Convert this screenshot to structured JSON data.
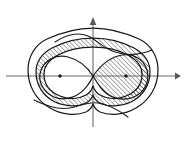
{
  "figure": {
    "width": 187,
    "height": 145,
    "background_color": "#ffffff",
    "line_color": "#1a1a1a",
    "axis_color": "#6b6b6b",
    "hatch_color": "#222222",
    "hatch_angle_degrees": 45,
    "hatch_spacing_px": 3.2
  },
  "axes": {
    "x_axis": {
      "label": "",
      "y_position": 76,
      "x_start": 6,
      "x_end": 181,
      "has_left_arrow": false,
      "has_right_arrow": true
    },
    "y_axis": {
      "label": "",
      "x_position": 93,
      "y_start": 127,
      "y_end": 19,
      "has_top_arrow": true,
      "has_bottom_arrow": false
    },
    "origin": {
      "x": 93,
      "y": 76
    }
  },
  "foci": [
    {
      "name": "left-focus",
      "x": 60,
      "y": 76
    },
    {
      "name": "right-focus",
      "x": 126,
      "y": 76
    }
  ],
  "curves": [
    {
      "name": "outer-oval",
      "type": "closed-cassini-oval",
      "description": "outermost single closed oval enclosing both foci"
    },
    {
      "name": "middle-oval",
      "type": "closed-cassini-oval",
      "description": "middle closed oval, outer edge of hatched band"
    },
    {
      "name": "inner-pinched-oval",
      "type": "closed-pinched-oval",
      "description": "inner waisted oval, inner edge of hatched band"
    },
    {
      "name": "lemniscate-left-lobe",
      "type": "lemniscate-branch",
      "description": "left lobe of the figure-eight through the origin"
    },
    {
      "name": "lemniscate-right-lobe",
      "type": "lemniscate-branch",
      "description": "right lobe of the figure-eight through the origin"
    },
    {
      "name": "upper-open-branch",
      "type": "open-hyperbolic-branch",
      "description": "open curve tail crossing above the origin"
    },
    {
      "name": "lower-open-branch",
      "type": "open-hyperbolic-branch",
      "description": "open curve tail crossing below the origin"
    }
  ],
  "regions": [
    {
      "name": "hatched-band",
      "fill": "diagonal-hatch",
      "description": "annular band between middle-oval and inner-pinched-oval"
    },
    {
      "name": "hatched-right-lobe",
      "fill": "diagonal-hatch",
      "description": "right lobe interior of the lemniscate, hatched"
    }
  ]
}
